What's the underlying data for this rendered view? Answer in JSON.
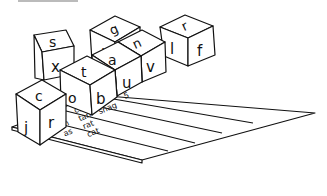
{
  "illustration": {
    "description": "Letter dice and a word-sorting chart",
    "dice": [
      {
        "top": "s",
        "front": "x"
      },
      {
        "top": "g",
        "front": "l"
      },
      {
        "top": "r",
        "front": "l",
        "side": "f"
      },
      {
        "top": "t",
        "front": "o",
        "side": "b"
      },
      {
        "top": "a",
        "front": "u"
      },
      {
        "top": "n",
        "front": "v"
      },
      {
        "top": "c",
        "front": "j",
        "side": "r"
      }
    ],
    "chart": {
      "columns": [
        {
          "number": "1",
          "words": [
            "a"
          ]
        },
        {
          "number": "2",
          "words": [
            "at",
            "an",
            "as"
          ]
        },
        {
          "number": "3",
          "words": [
            "can",
            "tan",
            "rat",
            "cat"
          ]
        },
        {
          "number": "4",
          "words": [
            "scat",
            "snag"
          ]
        },
        {
          "number": "5",
          "words": []
        }
      ]
    }
  }
}
